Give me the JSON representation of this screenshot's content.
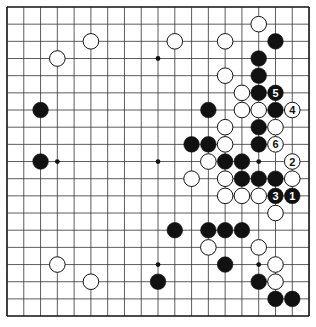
{
  "board": {
    "size": 19,
    "origin_x": 7,
    "origin_y": 7,
    "spacing_x": 16.78,
    "spacing_y": 17.17,
    "stone_radius": 7.8,
    "line_color": "#333333",
    "border_color": "#111111",
    "background": "#ffffff",
    "black_color": "#111111",
    "white_color": "#ffffff",
    "star_points": [
      [
        3,
        3
      ],
      [
        9,
        3
      ],
      [
        15,
        3
      ],
      [
        3,
        9
      ],
      [
        9,
        9
      ],
      [
        15,
        9
      ],
      [
        3,
        15
      ],
      [
        9,
        15
      ],
      [
        15,
        15
      ]
    ]
  },
  "stones": {
    "black": [
      {
        "x": 16,
        "y": 2
      },
      {
        "x": 15,
        "y": 3
      },
      {
        "x": 15,
        "y": 4
      },
      {
        "x": 15,
        "y": 5
      },
      {
        "x": 16,
        "y": 5,
        "label": "5"
      },
      {
        "x": 2,
        "y": 6
      },
      {
        "x": 12,
        "y": 6
      },
      {
        "x": 16,
        "y": 6
      },
      {
        "x": 15,
        "y": 7
      },
      {
        "x": 11,
        "y": 8
      },
      {
        "x": 12,
        "y": 8
      },
      {
        "x": 15,
        "y": 8
      },
      {
        "x": 2,
        "y": 9
      },
      {
        "x": 13,
        "y": 9
      },
      {
        "x": 14,
        "y": 9
      },
      {
        "x": 14,
        "y": 10
      },
      {
        "x": 15,
        "y": 10
      },
      {
        "x": 16,
        "y": 10
      },
      {
        "x": 16,
        "y": 11,
        "label": "3"
      },
      {
        "x": 17,
        "y": 11,
        "label": "1"
      },
      {
        "x": 10,
        "y": 13
      },
      {
        "x": 12,
        "y": 13
      },
      {
        "x": 13,
        "y": 13
      },
      {
        "x": 14,
        "y": 13
      },
      {
        "x": 13,
        "y": 15
      },
      {
        "x": 9,
        "y": 16
      },
      {
        "x": 15,
        "y": 16
      },
      {
        "x": 16,
        "y": 17
      },
      {
        "x": 17,
        "y": 17
      }
    ],
    "white": [
      {
        "x": 15,
        "y": 1
      },
      {
        "x": 5,
        "y": 2
      },
      {
        "x": 10,
        "y": 2
      },
      {
        "x": 13,
        "y": 2
      },
      {
        "x": 3,
        "y": 3
      },
      {
        "x": 13,
        "y": 4
      },
      {
        "x": 14,
        "y": 5
      },
      {
        "x": 14,
        "y": 6
      },
      {
        "x": 15,
        "y": 6
      },
      {
        "x": 17,
        "y": 6,
        "label": "4"
      },
      {
        "x": 13,
        "y": 7
      },
      {
        "x": 16,
        "y": 7
      },
      {
        "x": 13,
        "y": 8
      },
      {
        "x": 16,
        "y": 8,
        "label": "6"
      },
      {
        "x": 12,
        "y": 9
      },
      {
        "x": 17,
        "y": 9,
        "label": "2"
      },
      {
        "x": 11,
        "y": 10
      },
      {
        "x": 13,
        "y": 10
      },
      {
        "x": 17,
        "y": 10
      },
      {
        "x": 13,
        "y": 11
      },
      {
        "x": 14,
        "y": 11
      },
      {
        "x": 15,
        "y": 11
      },
      {
        "x": 16,
        "y": 12
      },
      {
        "x": 12,
        "y": 14
      },
      {
        "x": 15,
        "y": 14
      },
      {
        "x": 3,
        "y": 15
      },
      {
        "x": 16,
        "y": 15
      },
      {
        "x": 5,
        "y": 16
      },
      {
        "x": 16,
        "y": 16
      }
    ]
  },
  "move_sequence": [
    {
      "number": "1",
      "color": "black",
      "x": 17,
      "y": 11
    },
    {
      "number": "2",
      "color": "white",
      "x": 17,
      "y": 9
    },
    {
      "number": "3",
      "color": "black",
      "x": 16,
      "y": 11
    },
    {
      "number": "4",
      "color": "white",
      "x": 17,
      "y": 6
    },
    {
      "number": "5",
      "color": "black",
      "x": 16,
      "y": 5
    },
    {
      "number": "6",
      "color": "white",
      "x": 16,
      "y": 8
    }
  ]
}
